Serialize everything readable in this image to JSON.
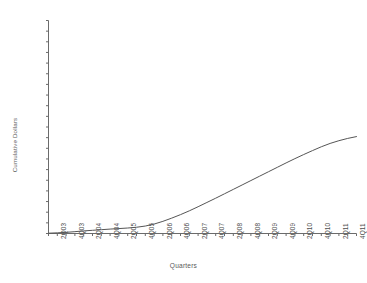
{
  "chart_data": {
    "type": "line",
    "title": "",
    "xlabel": "Quarters",
    "ylabel": "Cumulative Dollars",
    "ylim": [
      0.0,
      70.0
    ],
    "ytick_step": 3.5,
    "grid": false,
    "legend": false,
    "line_color": "#555555",
    "categories": [
      "1Q03",
      "2Q03",
      "3Q03",
      "4Q03",
      "1Q04",
      "2Q04",
      "3Q04",
      "4Q04",
      "1Q05",
      "2Q05",
      "3Q05",
      "4Q05",
      "1Q06",
      "2Q06",
      "3Q06",
      "4Q06",
      "1Q07",
      "2Q07",
      "3Q07",
      "4Q07",
      "1Q08",
      "2Q08",
      "3Q08",
      "4Q08",
      "1Q09",
      "2Q09",
      "3Q09",
      "4Q09",
      "1Q10",
      "2Q10",
      "3Q10",
      "4Q10",
      "1Q11",
      "2Q11",
      "3Q11",
      "4Q11"
    ],
    "visible_xtick_labels": [
      "2Q03",
      "4Q03",
      "2Q04",
      "4Q04",
      "2Q05",
      "4Q05",
      "2Q06",
      "4Q06",
      "2Q07",
      "4Q07",
      "2Q08",
      "4Q08",
      "2Q09",
      "4Q09",
      "2Q10",
      "4Q10",
      "2Q11",
      "4Q11"
    ],
    "ytick_labels": [
      "70.00",
      "66.50",
      "63.00",
      "59.50",
      "56.00",
      "52.50",
      "49.00",
      "45.50",
      "42.00",
      "38.50",
      "35.00",
      "31.50",
      "28.00",
      "24.50",
      "21.00",
      "17.50",
      "14.00",
      "10.50",
      "7.00",
      "3.50",
      "0.00"
    ],
    "ytick_values": [
      70.0,
      66.5,
      63.0,
      59.5,
      56.0,
      52.5,
      49.0,
      45.5,
      42.0,
      38.5,
      35.0,
      31.5,
      28.0,
      24.5,
      21.0,
      17.5,
      14.0,
      10.5,
      7.0,
      3.5,
      0.0
    ],
    "series": [
      {
        "name": "Cumulative Dollars",
        "values": [
          0.1,
          0.22,
          0.38,
          0.6,
          0.85,
          1.05,
          1.25,
          1.45,
          1.62,
          1.8,
          2.05,
          2.45,
          3.1,
          4.0,
          5.05,
          6.2,
          7.45,
          8.8,
          10.2,
          11.6,
          13.05,
          14.5,
          15.95,
          17.4,
          18.85,
          20.3,
          21.75,
          23.2,
          24.6,
          25.95,
          27.25,
          28.5,
          29.6,
          30.5,
          31.25,
          31.85
        ]
      }
    ]
  }
}
